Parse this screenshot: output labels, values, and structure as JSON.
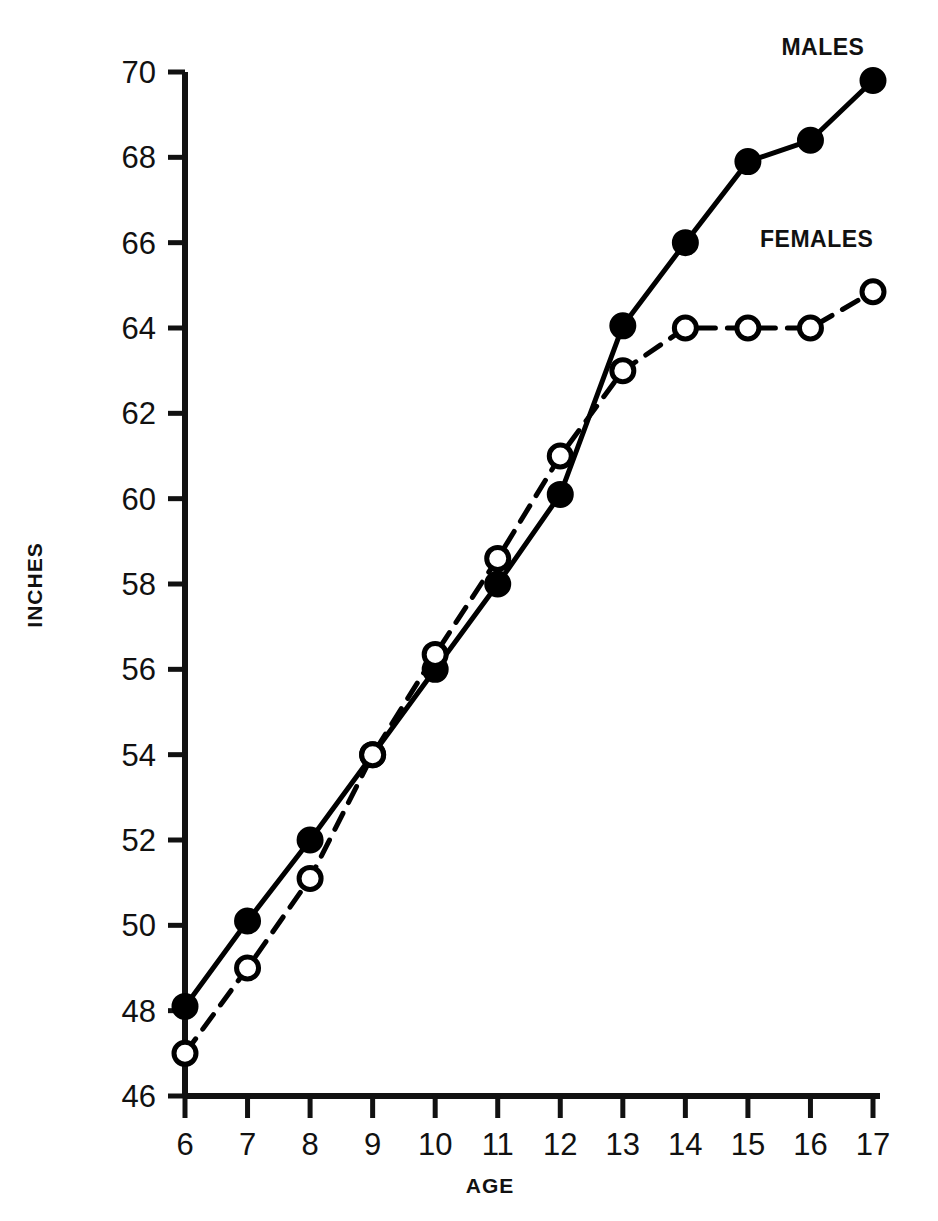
{
  "chart_data": {
    "type": "line",
    "title": "",
    "xlabel": "AGE",
    "ylabel": "INCHES",
    "x": [
      6,
      7,
      8,
      9,
      10,
      11,
      12,
      13,
      14,
      15,
      16,
      17
    ],
    "xtick_labels": [
      "6",
      "7",
      "8",
      "9",
      "10",
      "11",
      "12",
      "13",
      "14",
      "15",
      "16",
      "17"
    ],
    "ytick_labels": [
      "70",
      "68",
      "66",
      "64",
      "62",
      "60",
      "58",
      "56",
      "54",
      "52",
      "50",
      "48",
      "46"
    ],
    "yticks": [
      70,
      68,
      66,
      64,
      62,
      60,
      58,
      56,
      54,
      52,
      50,
      48,
      46
    ],
    "xlim": [
      6,
      17
    ],
    "ylim": [
      46,
      70
    ],
    "grid": false,
    "legend_position": "inline-annotations",
    "series": [
      {
        "name": "MALES",
        "marker": "filled-circle",
        "line_style": "solid",
        "color": "#000000",
        "values": [
          48.1,
          50.1,
          52.0,
          54.0,
          56.0,
          58.0,
          60.1,
          64.05,
          66.0,
          67.9,
          68.4,
          69.8
        ]
      },
      {
        "name": "FEMALES",
        "marker": "open-circle",
        "line_style": "dashed",
        "color": "#000000",
        "values": [
          47.0,
          49.0,
          51.1,
          54.0,
          56.35,
          58.6,
          61.0,
          63.0,
          64.0,
          64.0,
          64.0,
          64.85
        ]
      }
    ],
    "annotations": [
      {
        "text": "MALES",
        "x": 16.2,
        "y": 70.4
      },
      {
        "text": "FEMALES",
        "x": 16.1,
        "y": 65.9
      }
    ]
  }
}
